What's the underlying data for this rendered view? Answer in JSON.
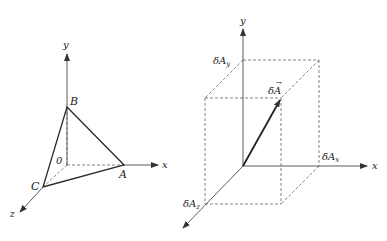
{
  "figure_left": {
    "title": "Triangle ABC in 3D coordinate system",
    "axes": {
      "x": "x",
      "y": "y",
      "z": "z"
    },
    "origin_label": "0",
    "points": {
      "A": "A",
      "B": "B",
      "C": "C"
    }
  },
  "figure_right": {
    "title": "Vector δA with components",
    "axes": {
      "x": "x",
      "y": "y",
      "z": "z"
    },
    "vector_label": "δA",
    "vector_arrow": "→",
    "components": {
      "x": "δA",
      "x_sub": "x",
      "y": "δA",
      "y_sub": "y",
      "z": "δA",
      "z_sub": "z"
    }
  },
  "colors": {
    "line": "#2a2a2a",
    "dashed": "#666666",
    "background": "#ffffff"
  }
}
